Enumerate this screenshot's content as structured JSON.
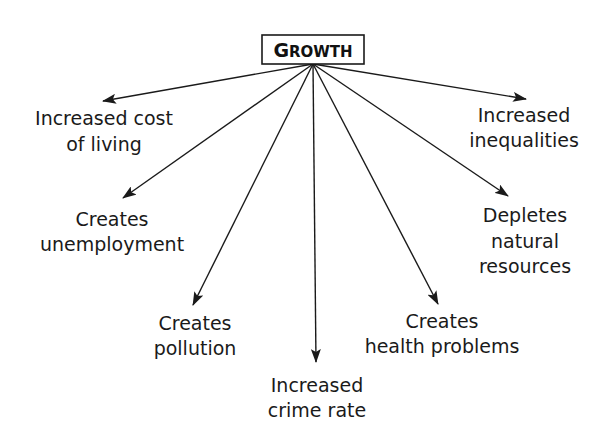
{
  "diagram": {
    "root": {
      "label_first": "G",
      "label_rest": "ROWTH",
      "box": {
        "x": 262,
        "y": 35,
        "w": 102,
        "h": 29
      },
      "origin": {
        "x": 313,
        "y": 64
      }
    },
    "colors": {
      "line": "#1a1a1a",
      "text": "#1a1a1a",
      "background": "#ffffff"
    },
    "branches": [
      {
        "id": "cost",
        "tip": {
          "x": 103,
          "y": 101
        },
        "lines": [
          {
            "text": "Increased cost",
            "x": 104,
            "y": 125
          },
          {
            "text": "of living",
            "x": 104,
            "y": 151
          }
        ]
      },
      {
        "id": "unemployment",
        "tip": {
          "x": 123,
          "y": 198
        },
        "lines": [
          {
            "text": "Creates",
            "x": 112,
            "y": 226
          },
          {
            "text": "unemployment",
            "x": 112,
            "y": 251
          }
        ]
      },
      {
        "id": "pollution",
        "tip": {
          "x": 193,
          "y": 305
        },
        "lines": [
          {
            "text": "Creates",
            "x": 195,
            "y": 330
          },
          {
            "text": "pollution",
            "x": 195,
            "y": 355
          }
        ]
      },
      {
        "id": "crime",
        "tip": {
          "x": 316,
          "y": 362
        },
        "lines": [
          {
            "text": "Increased",
            "x": 317,
            "y": 392
          },
          {
            "text": "crime rate",
            "x": 317,
            "y": 417
          }
        ]
      },
      {
        "id": "health",
        "tip": {
          "x": 438,
          "y": 304
        },
        "lines": [
          {
            "text": "Creates",
            "x": 442,
            "y": 328
          },
          {
            "text": "health problems",
            "x": 442,
            "y": 353
          }
        ]
      },
      {
        "id": "resources",
        "tip": {
          "x": 508,
          "y": 196
        },
        "lines": [
          {
            "text": "Depletes",
            "x": 525,
            "y": 222
          },
          {
            "text": "natural",
            "x": 525,
            "y": 248
          },
          {
            "text": "resources",
            "x": 525,
            "y": 273
          }
        ]
      },
      {
        "id": "inequalities",
        "tip": {
          "x": 526,
          "y": 99
        },
        "lines": [
          {
            "text": "Increased",
            "x": 524,
            "y": 122
          },
          {
            "text": "inequalities",
            "x": 524,
            "y": 147
          }
        ]
      }
    ]
  }
}
